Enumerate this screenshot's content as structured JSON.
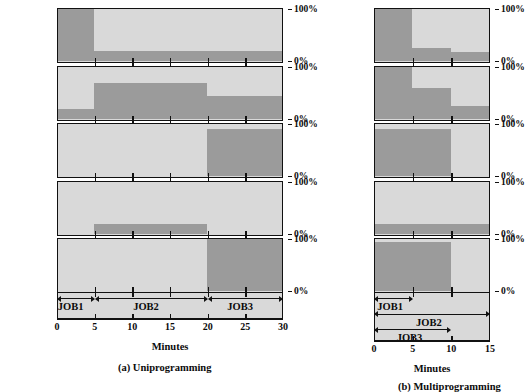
{
  "figure": {
    "colors": {
      "bar": "#9b9b9b",
      "panel": "#d9d9d9",
      "ink": "#111111",
      "page": "#ffffff"
    }
  },
  "axis_labels": {
    "pct_top": "100%",
    "pct_bottom": "0%",
    "minutes": "Minutes"
  },
  "row_labels": {
    "cpu": "CPU",
    "memory": "Memory",
    "disk": "Disk",
    "terminal": "Terminal",
    "printer": "Printer",
    "job_history": "Job history"
  },
  "charts": [
    {
      "id": "uniprogramming",
      "caption": "(a) Uniprogramming",
      "xlabel": "Minutes",
      "xlim": [
        0,
        30
      ],
      "xticks": [
        0,
        5,
        10,
        15,
        20,
        25,
        30
      ],
      "xtick_labels": [
        "0",
        "5",
        "10",
        "15",
        "20",
        "25",
        "30"
      ],
      "ylim_label_top": "100%",
      "ylim_label_bottom": "0%",
      "chart_data": {
        "type": "area",
        "title": "(a) Uniprogramming",
        "xlabel": "Minutes",
        "ylabel": "Utilization (%)",
        "xlim": [
          0,
          30
        ],
        "ylim": [
          0,
          100
        ],
        "grid": false,
        "legend": "none",
        "series": [
          {
            "name": "CPU",
            "steps": [
              {
                "x0": 0,
                "x1": 5,
                "value": 100
              },
              {
                "x0": 5,
                "x1": 30,
                "value": 20
              }
            ]
          },
          {
            "name": "Memory",
            "steps": [
              {
                "x0": 0,
                "x1": 5,
                "value": 20
              },
              {
                "x0": 5,
                "x1": 20,
                "value": 70
              },
              {
                "x0": 20,
                "x1": 30,
                "value": 45
              }
            ]
          },
          {
            "name": "Disk",
            "steps": [
              {
                "x0": 0,
                "x1": 20,
                "value": 0
              },
              {
                "x0": 20,
                "x1": 30,
                "value": 90
              }
            ]
          },
          {
            "name": "Terminal",
            "steps": [
              {
                "x0": 0,
                "x1": 5,
                "value": 0
              },
              {
                "x0": 5,
                "x1": 20,
                "value": 20
              },
              {
                "x0": 20,
                "x1": 30,
                "value": 0
              }
            ]
          },
          {
            "name": "Printer",
            "steps": [
              {
                "x0": 0,
                "x1": 20,
                "value": 0
              },
              {
                "x0": 20,
                "x1": 30,
                "value": 100
              }
            ]
          }
        ]
      },
      "job_history": [
        {
          "label": "JOB1",
          "start": 0,
          "end": 5
        },
        {
          "label": "JOB2",
          "start": 5,
          "end": 20
        },
        {
          "label": "JOB3",
          "start": 20,
          "end": 30
        }
      ]
    },
    {
      "id": "multiprogramming",
      "caption": "(b) Multiprogramming",
      "xlabel": "Minutes",
      "xlim": [
        0,
        15
      ],
      "xticks": [
        0,
        5,
        10,
        15
      ],
      "xtick_labels": [
        "0",
        "5",
        "10",
        "15"
      ],
      "ylim_label_top": "100%",
      "ylim_label_bottom": "0%",
      "chart_data": {
        "type": "area",
        "title": "(b) Multiprogramming",
        "xlabel": "Minutes",
        "ylabel": "Utilization (%)",
        "xlim": [
          0,
          15
        ],
        "ylim": [
          0,
          100
        ],
        "grid": false,
        "legend": "none",
        "series": [
          {
            "name": "CPU",
            "steps": [
              {
                "x0": 0,
                "x1": 5,
                "value": 100
              },
              {
                "x0": 5,
                "x1": 10,
                "value": 25
              },
              {
                "x0": 10,
                "x1": 15,
                "value": 18
              }
            ]
          },
          {
            "name": "Memory",
            "steps": [
              {
                "x0": 0,
                "x1": 5,
                "value": 100
              },
              {
                "x0": 5,
                "x1": 10,
                "value": 60
              },
              {
                "x0": 10,
                "x1": 15,
                "value": 25
              }
            ]
          },
          {
            "name": "Disk",
            "steps": [
              {
                "x0": 0,
                "x1": 10,
                "value": 90
              },
              {
                "x0": 10,
                "x1": 15,
                "value": 0
              }
            ]
          },
          {
            "name": "Terminal",
            "steps": [
              {
                "x0": 0,
                "x1": 15,
                "value": 20
              }
            ]
          },
          {
            "name": "Printer",
            "steps": [
              {
                "x0": 0,
                "x1": 10,
                "value": 95
              },
              {
                "x0": 10,
                "x1": 15,
                "value": 0
              }
            ]
          }
        ]
      },
      "job_history": [
        {
          "label": "JOB1",
          "start": 0,
          "end": 5
        },
        {
          "label": "JOB2",
          "start": 0,
          "end": 15
        },
        {
          "label": "JOB3",
          "start": 0,
          "end": 10
        }
      ]
    }
  ]
}
